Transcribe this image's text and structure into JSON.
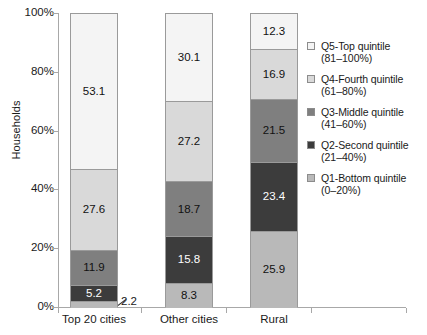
{
  "chart_data": {
    "type": "bar",
    "subtype": "stacked-100-percent",
    "title": "",
    "xlabel": "",
    "ylabel": "Households",
    "ylim": [
      0,
      100
    ],
    "ytick_labels": [
      "0%",
      "20%",
      "40%",
      "60%",
      "80%",
      "100%"
    ],
    "ytick_values": [
      0,
      20,
      40,
      60,
      80,
      100
    ],
    "grid": false,
    "legend_position": "right",
    "categories": [
      "Top 20 cities",
      "Other cities",
      "Rural"
    ],
    "series": [
      {
        "name": "Q1-Bottom quintile",
        "range": "(0–20%)",
        "color": "#b9b9b9",
        "values": [
          2.2,
          8.3,
          25.9
        ]
      },
      {
        "name": "Q2-Second quintile",
        "range": "(21–40%)",
        "color": "#4a4a4a",
        "values": [
          5.2,
          15.8,
          23.4
        ]
      },
      {
        "name": "Q3-Middle quintile",
        "range": "(41–60%)",
        "color": "#7f7f7f",
        "values": [
          11.9,
          18.7,
          21.5
        ]
      },
      {
        "name": "Q4-Fourth quintile",
        "range": "(61–80%)",
        "color": "#d9d9d9",
        "values": [
          27.6,
          27.2,
          16.9
        ]
      },
      {
        "name": "Q5-Top quintile",
        "range": "(81–100%)",
        "color": "#f4f4f4",
        "values": [
          53.1,
          30.1,
          12.3
        ]
      }
    ],
    "annotations": [
      {
        "text": "2.2",
        "note": "callout label for thin bottom segment of Top 20 cities"
      }
    ]
  },
  "axis": {
    "y_title": "Households",
    "ticks": [
      "100%",
      "80%",
      "60%",
      "40%",
      "20%",
      "0%"
    ]
  },
  "bars": [
    {
      "category": "Top 20 cities",
      "segments": [
        {
          "label": "53.1",
          "key": "q5"
        },
        {
          "label": "27.6",
          "key": "q4"
        },
        {
          "label": "11.9",
          "key": "q3"
        },
        {
          "label": "5.2",
          "key": "q2"
        },
        {
          "label": "2.2",
          "key": "q1"
        }
      ]
    },
    {
      "category": "Other cities",
      "segments": [
        {
          "label": "30.1",
          "key": "q5"
        },
        {
          "label": "27.2",
          "key": "q4"
        },
        {
          "label": "18.7",
          "key": "q3"
        },
        {
          "label": "15.8",
          "key": "q2"
        },
        {
          "label": "8.3",
          "key": "q1"
        }
      ]
    },
    {
      "category": "Rural",
      "segments": [
        {
          "label": "12.3",
          "key": "q5"
        },
        {
          "label": "16.9",
          "key": "q4"
        },
        {
          "label": "21.5",
          "key": "q3"
        },
        {
          "label": "23.4",
          "key": "q2"
        },
        {
          "label": "25.9",
          "key": "q1"
        }
      ]
    }
  ],
  "callout": {
    "text": "2.2"
  },
  "legend": {
    "items": [
      {
        "name": "Q5-Top quintile",
        "range": "(81–100%)",
        "color": "#f4f4f4"
      },
      {
        "name": "Q4-Fourth quintile",
        "range": "(61–80%)",
        "color": "#d9d9d9"
      },
      {
        "name": "Q3-Middle quintile",
        "range": "(41–60%)",
        "color": "#7f7f7f"
      },
      {
        "name": "Q2-Second quintile",
        "range": "(21–40%)",
        "color": "#3c3c3c"
      },
      {
        "name": "Q1-Bottom quintile",
        "range": "(0–20%)",
        "color": "#b9b9b9"
      }
    ]
  }
}
